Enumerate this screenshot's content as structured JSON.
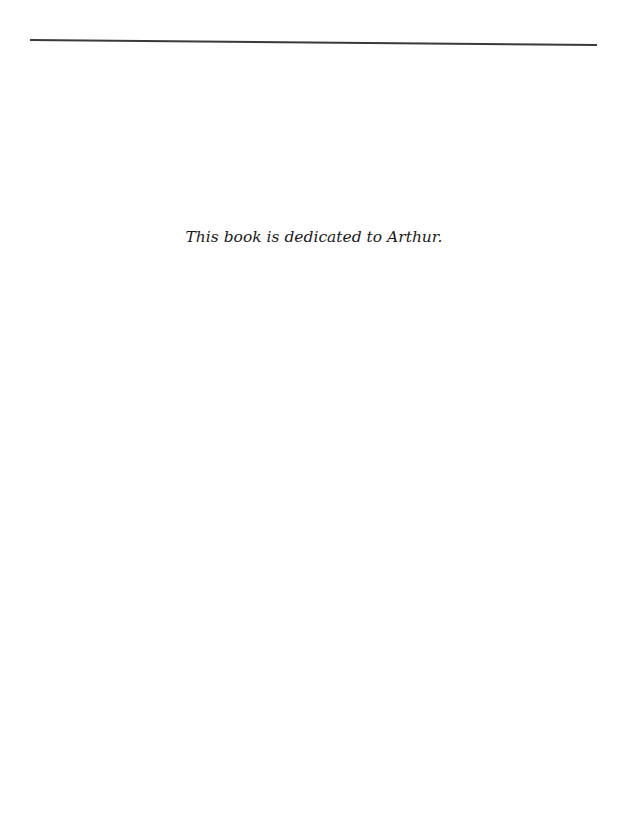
{
  "page": {
    "dedication": "This book is dedicated to Arthur."
  }
}
